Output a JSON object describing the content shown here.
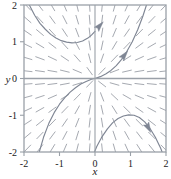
{
  "figure": {
    "kind": "direction-field-plot",
    "background": "#ffffff"
  },
  "chart_data": {
    "type": "scatter",
    "title": "",
    "subtitle": "",
    "xlabel": "x",
    "ylabel": "y",
    "xlim": [
      -2,
      2
    ],
    "ylim": [
      -2,
      2
    ],
    "xticks": [
      -2,
      -1,
      0,
      1,
      2
    ],
    "yticks": [
      -2,
      -1,
      0,
      1,
      2
    ],
    "xtick_labels": [
      "-2",
      "-1",
      "0",
      "1",
      "2"
    ],
    "ytick_labels": [
      "-2",
      "-1",
      "0",
      "1",
      "2"
    ],
    "grid": false,
    "legend": null,
    "legend_position": "none",
    "frame": true,
    "axis_lines": [
      "x=0",
      "y=0"
    ],
    "colors": {
      "field": "#8a8f99",
      "curve": "#7f8694",
      "axis": "#9aa0a8",
      "frame": "#9aa0a8",
      "text": "#1a1a1a"
    },
    "field": {
      "name": "direction-field",
      "x_samples": [
        -1.9,
        -1.55,
        -1.2,
        -0.85,
        -0.5,
        -0.15,
        0.2,
        0.55,
        0.9,
        1.25,
        1.6,
        1.95
      ],
      "y_samples": [
        1.95,
        1.6,
        1.25,
        0.9,
        0.55,
        0.2,
        -0.15,
        -0.5,
        -0.85,
        -1.2,
        -1.55,
        -1.9
      ],
      "slope_formula": "dy/dx = y/x",
      "tick_length": 9
    },
    "series": [
      {
        "name": "trajectory-upper-left",
        "type": "line",
        "points": [
          [
            -2.0,
            2.35
          ],
          [
            -1.85,
            2.0
          ],
          [
            -1.7,
            1.72
          ],
          [
            -1.55,
            1.5
          ],
          [
            -1.4,
            1.34
          ],
          [
            -1.25,
            1.2
          ],
          [
            -1.1,
            1.1
          ],
          [
            -0.95,
            1.03
          ],
          [
            -0.8,
            0.99
          ],
          [
            -0.65,
            0.97
          ],
          [
            -0.5,
            0.98
          ],
          [
            -0.35,
            1.02
          ],
          [
            -0.2,
            1.1
          ],
          [
            -0.1,
            1.18
          ],
          [
            0.0,
            1.28
          ]
        ],
        "arrow": {
          "at": [
            0.1,
            1.4
          ],
          "angle_deg": 48
        }
      },
      {
        "name": "trajectory-through-origin",
        "type": "line",
        "points": [
          [
            -1.6,
            -2.1
          ],
          [
            -1.45,
            -1.6
          ],
          [
            -1.3,
            -1.22
          ],
          [
            -1.15,
            -0.93
          ],
          [
            -1.0,
            -0.7
          ],
          [
            -0.85,
            -0.52
          ],
          [
            -0.7,
            -0.37
          ],
          [
            -0.55,
            -0.25
          ],
          [
            -0.4,
            -0.15
          ],
          [
            -0.25,
            -0.08
          ],
          [
            -0.1,
            -0.02
          ],
          [
            0.0,
            0.0
          ],
          [
            0.15,
            0.05
          ],
          [
            0.3,
            0.12
          ],
          [
            0.45,
            0.22
          ],
          [
            0.6,
            0.35
          ],
          [
            0.75,
            0.52
          ],
          [
            0.9,
            0.74
          ],
          [
            1.05,
            1.0
          ],
          [
            1.2,
            1.32
          ],
          [
            1.35,
            1.7
          ],
          [
            1.5,
            2.15
          ]
        ],
        "arrow": {
          "at": [
            0.8,
            0.6
          ],
          "angle_deg": 52
        }
      },
      {
        "name": "trajectory-lower-right",
        "type": "line",
        "points": [
          [
            -0.1,
            -2.2
          ],
          [
            0.05,
            -1.85
          ],
          [
            0.2,
            -1.58
          ],
          [
            0.35,
            -1.37
          ],
          [
            0.5,
            -1.2
          ],
          [
            0.65,
            -1.09
          ],
          [
            0.8,
            -1.02
          ],
          [
            0.95,
            -0.99
          ],
          [
            1.1,
            -1.0
          ],
          [
            1.25,
            -1.06
          ],
          [
            1.4,
            -1.18
          ],
          [
            1.55,
            -1.36
          ],
          [
            1.7,
            -1.6
          ],
          [
            1.85,
            -1.9
          ],
          [
            1.95,
            -2.15
          ]
        ],
        "arrow": {
          "at": [
            1.48,
            -1.3
          ],
          "angle_deg": -62
        }
      }
    ]
  },
  "labels": {
    "x_axis": "x",
    "y_axis": "y"
  }
}
